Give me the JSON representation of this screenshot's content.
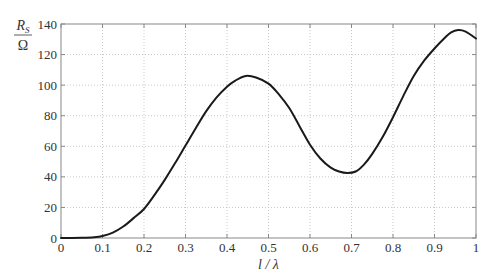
{
  "chart_data": {
    "type": "line",
    "title": "",
    "xlabel": "l / λ",
    "ylabel_top": "R_S",
    "ylabel_bottom": "Ω",
    "xlim": [
      0,
      1
    ],
    "ylim": [
      0,
      140
    ],
    "grid": true,
    "legend": null,
    "x_ticks": [
      0,
      0.1,
      0.2,
      0.3,
      0.4,
      0.5,
      0.6,
      0.7,
      0.8,
      0.9,
      1
    ],
    "x_tick_labels": [
      "0",
      "0.1",
      "0.2",
      "0.3",
      "0.4",
      "0.5",
      "0.6",
      "0.7",
      "0.8",
      "0.9",
      "1"
    ],
    "y_ticks": [
      0,
      20,
      40,
      60,
      80,
      100,
      120,
      140
    ],
    "y_tick_labels": [
      "0",
      "20",
      "40",
      "60",
      "80",
      "100",
      "120",
      "140"
    ],
    "series": [
      {
        "name": "R_S",
        "color": "#1a1a1a",
        "x": [
          0.0,
          0.02,
          0.05,
          0.08,
          0.1,
          0.125,
          0.15,
          0.175,
          0.2,
          0.225,
          0.25,
          0.275,
          0.3,
          0.325,
          0.35,
          0.375,
          0.4,
          0.42,
          0.445,
          0.47,
          0.5,
          0.525,
          0.55,
          0.575,
          0.6,
          0.625,
          0.65,
          0.67,
          0.69,
          0.71,
          0.73,
          0.75,
          0.775,
          0.8,
          0.825,
          0.85,
          0.875,
          0.9,
          0.925,
          0.94,
          0.957,
          0.975,
          1.0
        ],
        "y": [
          0,
          0,
          0.1,
          0.5,
          1.3,
          3.5,
          7.5,
          13,
          19,
          28,
          38,
          49,
          60.5,
          72,
          83,
          92,
          99,
          103,
          106,
          105,
          101,
          94,
          85,
          73,
          61,
          52,
          46,
          43.5,
          42.5,
          43.5,
          48,
          55,
          66,
          79,
          93,
          106,
          116,
          124,
          131,
          134.5,
          136,
          135,
          130.5
        ]
      }
    ]
  }
}
